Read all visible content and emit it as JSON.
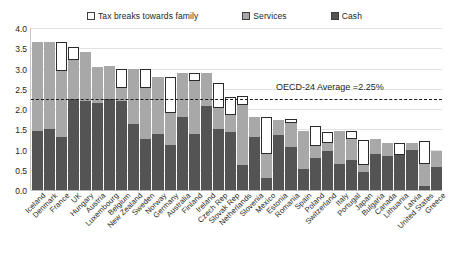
{
  "legend": {
    "items": [
      {
        "label": "Tax breaks towards family",
        "key": "tax",
        "color": "#ffffff"
      },
      {
        "label": "Services",
        "key": "services",
        "color": "#a8a8a8"
      },
      {
        "label": "Cash",
        "key": "cash",
        "color": "#545454"
      }
    ]
  },
  "annotation": {
    "text": "OECD-24 Average =2.25%",
    "value": 2.25
  },
  "chart_data": {
    "type": "bar",
    "title": "",
    "subtitle": "",
    "xlabel": "",
    "ylabel": "",
    "ylim": [
      0.0,
      4.0
    ],
    "ytick_labels": [
      "4.0",
      "3.5",
      "3.0",
      "2.5",
      "2.0",
      "1.5",
      "1.0",
      "0.5",
      "0.0"
    ],
    "yticks": [
      4.0,
      3.5,
      3.0,
      2.5,
      2.0,
      1.5,
      1.0,
      0.5,
      0.0
    ],
    "grid": true,
    "stacked": true,
    "legend_position": "top",
    "reference_line": {
      "label": "OECD-24 Average =2.25%",
      "value": 2.25,
      "style": "dash-dot"
    },
    "categories": [
      "Iceland",
      "Denmark",
      "France",
      "UK",
      "Hungary",
      "Austria",
      "Luxembourg",
      "Belgium",
      "New Zealand",
      "Sweden",
      "Norway",
      "Germany",
      "Australia",
      "Finland",
      "Ireland",
      "Czech Rep",
      "Slovak Rep",
      "Netherlands",
      "Slovenia",
      "Mexico",
      "Estonia",
      "Romania",
      "Spain",
      "Poland",
      "Switzerland",
      "Italy",
      "Portugal",
      "Japan",
      "Bulgaria",
      "Canada",
      "Lithuania",
      "Latvia",
      "United States",
      "Greece"
    ],
    "series": [
      {
        "name": "Cash",
        "color": "#545454",
        "values": [
          1.45,
          1.5,
          1.3,
          2.25,
          2.2,
          2.15,
          2.25,
          2.2,
          1.62,
          1.25,
          1.38,
          1.1,
          1.8,
          1.38,
          2.08,
          1.5,
          1.43,
          0.63,
          1.3,
          0.3,
          1.36,
          1.05,
          0.53,
          0.78,
          0.97,
          0.65,
          0.75,
          0.45,
          0.9,
          0.83,
          0.87,
          0.98,
          0.1,
          0.57
        ]
      },
      {
        "name": "Services",
        "color": "#a8a8a8",
        "values": [
          2.2,
          2.15,
          1.63,
          0.97,
          1.2,
          0.9,
          0.8,
          0.33,
          1.36,
          1.28,
          1.42,
          0.8,
          1.1,
          1.32,
          0.82,
          0.52,
          0.42,
          1.48,
          0.5,
          0.6,
          0.38,
          0.6,
          0.93,
          0.3,
          0.18,
          0.8,
          0.52,
          0.18,
          0.35,
          0.33,
          0.0,
          0.17,
          0.55,
          0.4
        ]
      },
      {
        "name": "Tax breaks towards family",
        "color": "#ffffff",
        "values": [
          0.0,
          0.0,
          0.72,
          0.3,
          0.0,
          0.0,
          0.0,
          0.45,
          0.0,
          0.45,
          0.0,
          0.9,
          0.0,
          0.18,
          0.0,
          0.63,
          0.45,
          0.2,
          0.0,
          0.9,
          0.0,
          0.1,
          0.0,
          0.5,
          0.28,
          0.0,
          0.18,
          0.6,
          0.0,
          0.0,
          0.3,
          0.0,
          0.55,
          0.0
        ]
      }
    ],
    "totals": [
      3.65,
      3.65,
      3.65,
      3.52,
      3.4,
      3.05,
      3.05,
      2.98,
      2.98,
      2.98,
      2.8,
      2.8,
      2.9,
      2.88,
      2.9,
      2.65,
      2.3,
      2.31,
      1.8,
      1.8,
      1.74,
      1.75,
      1.46,
      1.58,
      1.43,
      1.45,
      1.45,
      1.23,
      1.25,
      1.16,
      1.17,
      1.15,
      1.2,
      0.97
    ]
  }
}
